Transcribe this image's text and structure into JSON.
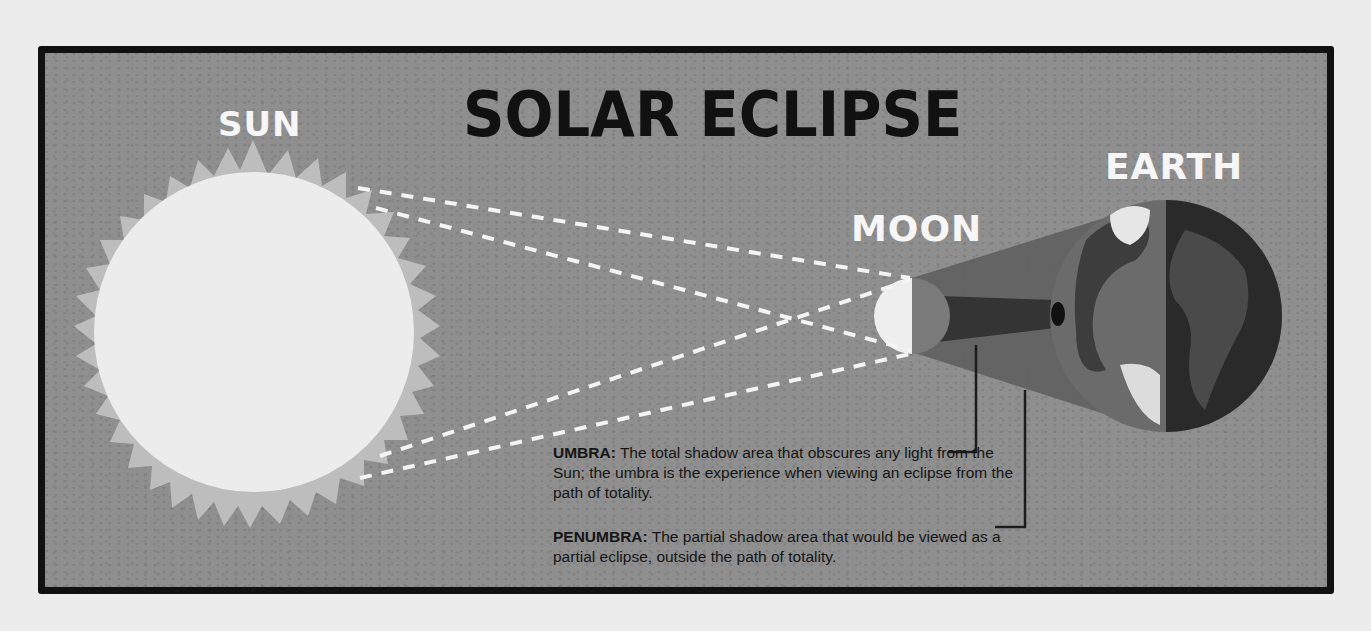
{
  "title": "SOLAR ECLIPSE",
  "labels": {
    "sun": "SUN",
    "moon": "MOON",
    "earth": "EARTH"
  },
  "definitions": {
    "umbra": {
      "term": "UMBRA:",
      "text": " The total shadow area that obscures any light from the Sun; the umbra is the experience when viewing an eclipse from the path of totality."
    },
    "penumbra": {
      "term": "PENUMBRA:",
      "text": " The partial shadow area that would be viewed as a partial eclipse, outside the path of totality."
    }
  },
  "colors": {
    "background": "#8f8f8f",
    "border": "#111111",
    "sun_core": "#ececec",
    "sun_rays": "#bdbdbd",
    "umbra": "#3a3a3a",
    "penumbra": "#5f5f5f",
    "dashes": "#f4f4f4"
  }
}
